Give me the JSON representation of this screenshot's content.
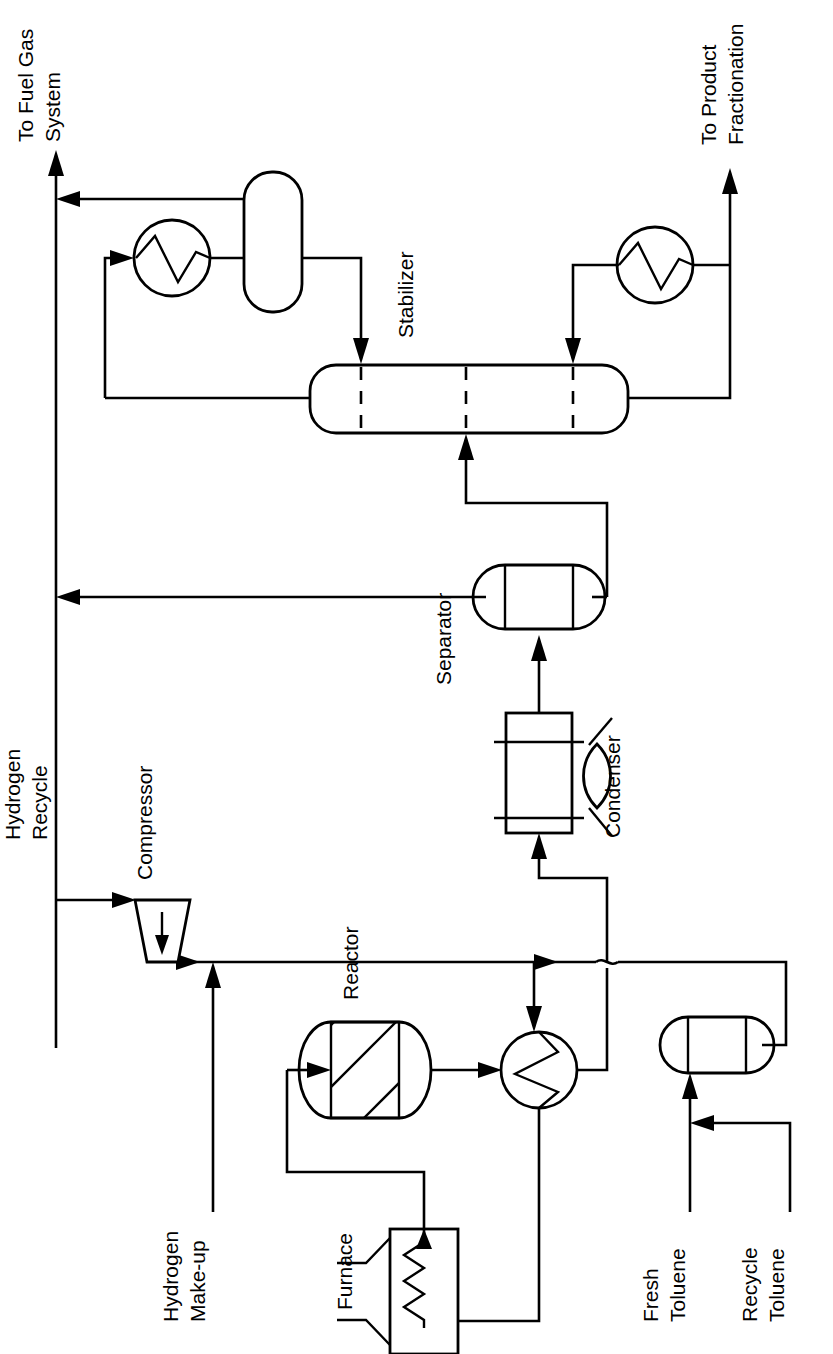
{
  "diagram": {
    "type": "process-flow-diagram",
    "orientation": "rotated-90-counterclockwise",
    "line_color": "#000000",
    "background_color": "#ffffff"
  },
  "equipment": [
    {
      "id": "compressor",
      "label": "Compressor",
      "symbol": "trapezoid-with-arrow"
    },
    {
      "id": "furnace",
      "label": "Furnace",
      "symbol": "box-with-coil-and-burners"
    },
    {
      "id": "reactor",
      "label": "Reactor",
      "symbol": "horizontal-vessel-hatched-bed"
    },
    {
      "id": "feed-effluent-exchanger",
      "label": "",
      "symbol": "circle-zigzag-heat-exchanger"
    },
    {
      "id": "condenser",
      "label": "Condenser",
      "symbol": "air-cooler-with-fan"
    },
    {
      "id": "separator",
      "label": "Separator",
      "symbol": "horizontal-drum"
    },
    {
      "id": "stabilizer",
      "label": "Stabilizer",
      "symbol": "horizontal-column-with-trays"
    },
    {
      "id": "overhead-condenser",
      "label": "",
      "symbol": "circle-zigzag-heat-exchanger"
    },
    {
      "id": "reflux-drum",
      "label": "",
      "symbol": "rounded-rect-drum"
    },
    {
      "id": "reboiler",
      "label": "",
      "symbol": "circle-zigzag-heat-exchanger"
    },
    {
      "id": "toluene-drum",
      "label": "",
      "symbol": "horizontal-drum"
    }
  ],
  "streams": [
    {
      "id": "to-fuel-gas-system",
      "label": "To Fuel Gas\nSystem",
      "line1": "To Fuel Gas",
      "line2": "System"
    },
    {
      "id": "to-product-fractionation",
      "label": "To Product\nFractionation",
      "line1": "To Product",
      "line2": "Fractionation"
    },
    {
      "id": "hydrogen-recycle",
      "label": "Hydrogen\nRecycle",
      "line1": "Hydrogen",
      "line2": "Recycle"
    },
    {
      "id": "hydrogen-make-up",
      "label": "Hydrogen\nMake-up",
      "line1": "Hydrogen",
      "line2": "Make-up"
    },
    {
      "id": "fresh-toluene",
      "label": "Fresh\nToluene",
      "line1": "Fresh",
      "line2": "Toluene"
    },
    {
      "id": "recycle-toluene",
      "label": "Recycle\nToluene",
      "line1": "Recycle",
      "line2": "Toluene"
    }
  ],
  "labels": {
    "to_fuel_gas_1": "To Fuel Gas",
    "to_fuel_gas_2": "System",
    "to_product_1": "To Product",
    "to_product_2": "Fractionation",
    "stabilizer": "Stabilizer",
    "separator": "Separator",
    "condenser": "Condenser",
    "hydrogen_recycle_1": "Hydrogen",
    "hydrogen_recycle_2": "Recycle",
    "compressor": "Compressor",
    "reactor": "Reactor",
    "hydrogen_makeup_1": "Hydrogen",
    "hydrogen_makeup_2": "Make-up",
    "furnace": "Furnace",
    "fresh_toluene_1": "Fresh",
    "fresh_toluene_2": "Toluene",
    "recycle_toluene_1": "Recycle",
    "recycle_toluene_2": "Toluene"
  }
}
